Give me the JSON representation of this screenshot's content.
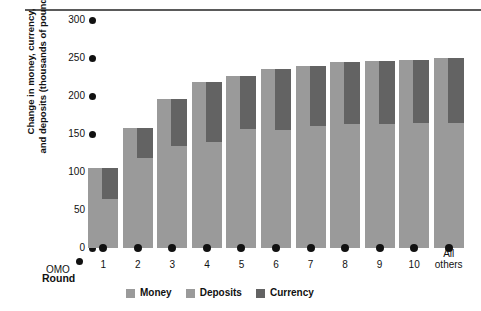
{
  "chart_data": {
    "type": "bar",
    "title": "",
    "subtitle": "",
    "xlabel": "Round",
    "ylabel_line1": "Change in money, currency,",
    "ylabel_line2": "and deposits (thousands of pounds)",
    "ylim": [
      0,
      300
    ],
    "yticks": [
      0,
      50,
      100,
      150,
      200,
      250,
      300
    ],
    "ytick_labels": [
      "0",
      "50",
      "100",
      "150",
      "200",
      "250",
      "300"
    ],
    "grid": false,
    "legend_position": "bottom",
    "origin_label": "OMO",
    "categories": [
      "1",
      "2",
      "3",
      "4",
      "5",
      "6",
      "7",
      "8",
      "9",
      "10",
      "All others"
    ],
    "category_label_line2": [
      "",
      "",
      "",
      "",
      "",
      "",
      "",
      "",
      "",
      "",
      "others"
    ],
    "series": [
      {
        "name": "Money",
        "color": "#9a9a9a",
        "values": [
          105,
          158,
          196,
          218,
          226,
          236,
          240,
          245,
          246,
          248,
          250
        ]
      },
      {
        "name": "Deposits",
        "color": "#9a9a9a",
        "values": [
          64,
          119,
          134,
          140,
          156,
          155,
          160,
          163,
          163,
          164,
          165
        ]
      },
      {
        "name": "Currency",
        "color": "#636363",
        "values": [
          41,
          39,
          62,
          78,
          70,
          81,
          80,
          82,
          83,
          84,
          85
        ]
      }
    ],
    "legend": [
      {
        "label": "Money",
        "color": "#9a9a9a"
      },
      {
        "label": "Deposits",
        "color": "#9a9a9a"
      },
      {
        "label": "Currency",
        "color": "#636363"
      }
    ]
  }
}
